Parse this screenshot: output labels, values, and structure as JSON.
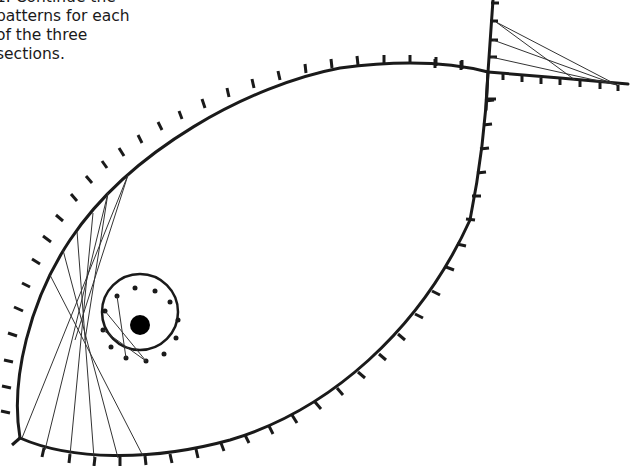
{
  "instructions": {
    "text": "1. Continue the\npatterns for each\nof the three\nsections."
  },
  "diagram": {
    "colors": {
      "outline": "#1a1a1a",
      "string": "#333333",
      "background": "#ffffff"
    },
    "sections": [
      {
        "name": "body-curve-left",
        "description": "Strings connecting upper-left body edge to bottom edge"
      },
      {
        "name": "eye-circle",
        "description": "Circle of 12 pins around the eye with chords"
      },
      {
        "name": "tail-angle",
        "description": "Strings connecting vertical tail line to horizontal tail line"
      }
    ]
  }
}
